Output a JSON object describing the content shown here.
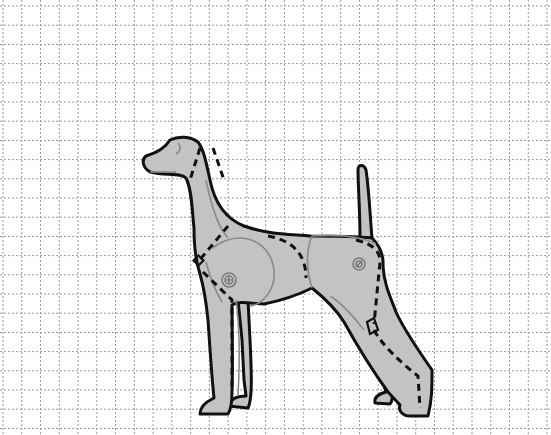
{
  "diagram": {
    "title": "Dog template on grid",
    "colors": {
      "background": "#ffffff",
      "grid": "#9a9a9a",
      "body_fill": "#c3c3c3",
      "outline": "#111111",
      "inner_lines": "#8a8a8a"
    },
    "grid": {
      "style": "dotted",
      "columns": 29,
      "rows": 22,
      "x_start": 3,
      "x_step": 18.76,
      "y_start": 6,
      "y_step": 19.2
    },
    "parts": [
      {
        "name": "head",
        "label": "Head"
      },
      {
        "name": "neck",
        "label": "Neck"
      },
      {
        "name": "shoulder",
        "label": "Shoulder joint"
      },
      {
        "name": "torso",
        "label": "Torso"
      },
      {
        "name": "hip",
        "label": "Hip joint"
      },
      {
        "name": "tail",
        "label": "Tail"
      },
      {
        "name": "front-legs",
        "label": "Front legs"
      },
      {
        "name": "hind-legs",
        "label": "Hind legs"
      }
    ],
    "joint_icons": [
      {
        "name": "shoulder-pivot-icon",
        "glyph": "⊕"
      },
      {
        "name": "hip-pivot-icon",
        "glyph": "⊘"
      }
    ],
    "cut_lines": "dashed",
    "fold_lines": "thin grey"
  }
}
